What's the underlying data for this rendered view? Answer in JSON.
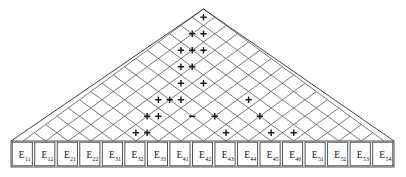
{
  "figure": {
    "width": 406,
    "height": 177,
    "background_color": "#ffffff",
    "line_color": "#555a5e",
    "outline_color": "#3d4246",
    "sign_color": "#1a1a1a"
  },
  "lattice": {
    "type": "diamond-triangle",
    "rows": 8,
    "bottom_cells": 17,
    "apex_x": 203.5,
    "apex_y": 9.0,
    "baseline_y": 141.0,
    "cell_width": 22.55,
    "cell_height": 16.5,
    "left_x": 11.0,
    "right_x": 394.0
  },
  "signs": {
    "plus_glyph": "+",
    "minus_glyph": "−",
    "marks": [
      {
        "sign": "+",
        "row": 0,
        "col": 0
      },
      {
        "sign": "+",
        "row": 1,
        "col": 0
      },
      {
        "sign": "+",
        "row": 1,
        "col": 1
      },
      {
        "sign": "+",
        "row": 2,
        "col": 0
      },
      {
        "sign": "+",
        "row": 2,
        "col": 1
      },
      {
        "sign": "+",
        "row": 2,
        "col": 2
      },
      {
        "sign": "+",
        "row": 3,
        "col": 1
      },
      {
        "sign": "+",
        "row": 3,
        "col": 2
      },
      {
        "sign": "+",
        "row": 4,
        "col": 2
      },
      {
        "sign": "+",
        "row": 4,
        "col": 4
      },
      {
        "sign": "+",
        "row": 5,
        "col": 1
      },
      {
        "sign": "+",
        "row": 5,
        "col": 2
      },
      {
        "sign": "+",
        "row": 5,
        "col": 3
      },
      {
        "sign": "+",
        "row": 5,
        "col": 9
      },
      {
        "sign": "+",
        "row": 6,
        "col": 1
      },
      {
        "sign": "+",
        "row": 6,
        "col": 2
      },
      {
        "sign": "+",
        "row": 6,
        "col": 11
      },
      {
        "sign": "−",
        "row": 6,
        "col": 5
      },
      {
        "sign": "+",
        "row": 6,
        "col": 7
      },
      {
        "sign": "+",
        "row": 7,
        "col": 1
      },
      {
        "sign": "+",
        "row": 7,
        "col": 2
      },
      {
        "sign": "+",
        "row": 7,
        "col": 9
      },
      {
        "sign": "+",
        "row": 7,
        "col": 13
      },
      {
        "sign": "+",
        "row": 7,
        "col": 15
      }
    ]
  },
  "bottom_row": {
    "label_base": "E",
    "cells": [
      {
        "base": "E",
        "sub": "11"
      },
      {
        "base": "E",
        "sub": "12"
      },
      {
        "base": "E",
        "sub": "21"
      },
      {
        "base": "E",
        "sub": "22"
      },
      {
        "base": "E",
        "sub": "31"
      },
      {
        "base": "E",
        "sub": "32"
      },
      {
        "base": "E",
        "sub": "33"
      },
      {
        "base": "E",
        "sub": "41"
      },
      {
        "base": "E",
        "sub": "42"
      },
      {
        "base": "E",
        "sub": "43"
      },
      {
        "base": "E",
        "sub": "44"
      },
      {
        "base": "E",
        "sub": "45"
      },
      {
        "base": "E",
        "sub": "46"
      },
      {
        "base": "E",
        "sub": "51"
      },
      {
        "base": "E",
        "sub": "52"
      },
      {
        "base": "E",
        "sub": "53"
      },
      {
        "base": "E",
        "sub": "54"
      }
    ]
  }
}
